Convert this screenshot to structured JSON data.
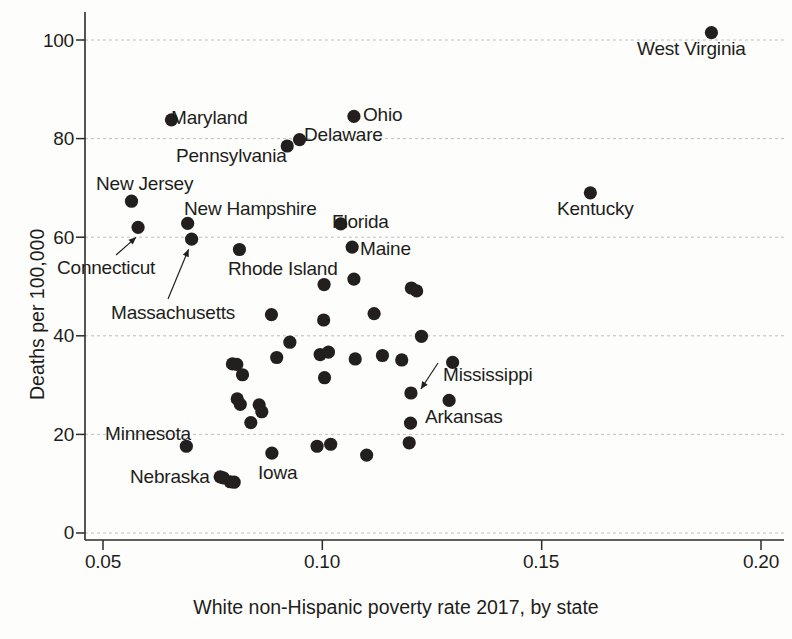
{
  "chart_data": {
    "type": "scatter",
    "title": "",
    "xlabel": "White non-Hispanic poverty rate 2017, by state",
    "ylabel": "Deaths per 100,000",
    "xlim": [
      0.0445,
      0.2025
    ],
    "ylim": [
      -6,
      108
    ],
    "xticks": [
      "0.05",
      "0.10",
      "0.15",
      "0.20"
    ],
    "xtick_values": [
      0.05,
      0.1,
      0.15,
      0.2
    ],
    "yticks": [
      "0",
      "20",
      "40",
      "60",
      "80",
      "100"
    ],
    "ytick_values": [
      0,
      20,
      40,
      60,
      80,
      100
    ],
    "grid": "horizontal-dashed",
    "legend": "none",
    "marker": "filled-circle",
    "marker_color": "#231f1e",
    "points": [
      {
        "label": "West Virginia",
        "x": 0.1887,
        "y": 101.5,
        "label_pos": "below"
      },
      {
        "label": "Ohio",
        "x": 0.1072,
        "y": 84.5,
        "label_pos": "right"
      },
      {
        "label": "Maryland",
        "x": 0.0656,
        "y": 83.8,
        "label_pos": "right"
      },
      {
        "label": "Delaware",
        "x": 0.0948,
        "y": 79.8,
        "label_pos": "right"
      },
      {
        "label": "Pennsylvania",
        "x": 0.092,
        "y": 78.5,
        "label_pos": "below"
      },
      {
        "label": "Kentucky",
        "x": 0.1611,
        "y": 69.0,
        "label_pos": "below"
      },
      {
        "label": "New Jersey",
        "x": 0.0565,
        "y": 67.3,
        "label_pos": "above"
      },
      {
        "label": "New Hampshire",
        "x": 0.0693,
        "y": 62.8,
        "label_pos": "above"
      },
      {
        "label": "Florida",
        "x": 0.1042,
        "y": 62.7,
        "label_pos": "right"
      },
      {
        "label": "Connecticut",
        "x": 0.058,
        "y": 62.0,
        "label_pos": "arrow-lower-left"
      },
      {
        "label": "Massachusetts",
        "x": 0.0702,
        "y": 59.6,
        "label_pos": "arrow-lower-left"
      },
      {
        "label": "Maine",
        "x": 0.1068,
        "y": 58.0,
        "label_pos": "right"
      },
      {
        "label": "Rhode Island",
        "x": 0.0811,
        "y": 57.5,
        "label_pos": "below"
      },
      {
        "label": "",
        "x": 0.1004,
        "y": 50.4,
        "label_pos": "none"
      },
      {
        "label": "",
        "x": 0.1072,
        "y": 51.5,
        "label_pos": "none"
      },
      {
        "label": "",
        "x": 0.1203,
        "y": 49.7,
        "label_pos": "none"
      },
      {
        "label": "",
        "x": 0.1215,
        "y": 49.1,
        "label_pos": "none"
      },
      {
        "label": "",
        "x": 0.0884,
        "y": 44.3,
        "label_pos": "none"
      },
      {
        "label": "",
        "x": 0.1003,
        "y": 43.2,
        "label_pos": "none"
      },
      {
        "label": "",
        "x": 0.1118,
        "y": 44.5,
        "label_pos": "none"
      },
      {
        "label": "",
        "x": 0.1226,
        "y": 39.9,
        "label_pos": "none"
      },
      {
        "label": "",
        "x": 0.0926,
        "y": 38.7,
        "label_pos": "none"
      },
      {
        "label": "",
        "x": 0.0795,
        "y": 34.3,
        "label_pos": "none"
      },
      {
        "label": "",
        "x": 0.0805,
        "y": 34.2,
        "label_pos": "none"
      },
      {
        "label": "",
        "x": 0.0896,
        "y": 35.6,
        "label_pos": "none"
      },
      {
        "label": "",
        "x": 0.0995,
        "y": 36.2,
        "label_pos": "none"
      },
      {
        "label": "",
        "x": 0.1014,
        "y": 36.7,
        "label_pos": "none"
      },
      {
        "label": "",
        "x": 0.1075,
        "y": 35.3,
        "label_pos": "none"
      },
      {
        "label": "",
        "x": 0.1137,
        "y": 36.0,
        "label_pos": "none"
      },
      {
        "label": "",
        "x": 0.1181,
        "y": 35.1,
        "label_pos": "none"
      },
      {
        "label": "",
        "x": 0.1297,
        "y": 34.6,
        "label_pos": "none"
      },
      {
        "label": "",
        "x": 0.0818,
        "y": 32.1,
        "label_pos": "none"
      },
      {
        "label": "",
        "x": 0.1005,
        "y": 31.5,
        "label_pos": "none"
      },
      {
        "label": "Mississippi",
        "x": 0.1202,
        "y": 28.4,
        "label_pos": "arrow-right"
      },
      {
        "label": "",
        "x": 0.0806,
        "y": 27.2,
        "label_pos": "none"
      },
      {
        "label": "",
        "x": 0.0813,
        "y": 26.1,
        "label_pos": "none"
      },
      {
        "label": "",
        "x": 0.0856,
        "y": 26.0,
        "label_pos": "none"
      },
      {
        "label": "Arkansas",
        "x": 0.1289,
        "y": 26.9,
        "label_pos": "below"
      },
      {
        "label": "",
        "x": 0.0862,
        "y": 24.6,
        "label_pos": "none"
      },
      {
        "label": "",
        "x": 0.0837,
        "y": 22.4,
        "label_pos": "none"
      },
      {
        "label": "",
        "x": 0.1201,
        "y": 22.3,
        "label_pos": "none"
      },
      {
        "label": "Minnesota",
        "x": 0.069,
        "y": 17.6,
        "label_pos": "left"
      },
      {
        "label": "",
        "x": 0.0988,
        "y": 17.6,
        "label_pos": "none"
      },
      {
        "label": "",
        "x": 0.1019,
        "y": 18.0,
        "label_pos": "none"
      },
      {
        "label": "",
        "x": 0.1198,
        "y": 18.3,
        "label_pos": "none"
      },
      {
        "label": "Iowa",
        "x": 0.0885,
        "y": 16.2,
        "label_pos": "below"
      },
      {
        "label": "",
        "x": 0.1101,
        "y": 15.8,
        "label_pos": "none"
      },
      {
        "label": "Nebraska",
        "x": 0.0767,
        "y": 11.4,
        "label_pos": "left"
      },
      {
        "label": "",
        "x": 0.0774,
        "y": 11.2,
        "label_pos": "none"
      },
      {
        "label": "",
        "x": 0.079,
        "y": 10.4,
        "label_pos": "none"
      },
      {
        "label": "",
        "x": 0.0799,
        "y": 10.3,
        "label_pos": "none"
      }
    ],
    "annotations": [
      {
        "text": "Connecticut",
        "type": "leader-arrow",
        "target_point": "Connecticut"
      },
      {
        "text": "Massachusetts",
        "type": "leader-arrow",
        "target_point": "Massachusetts"
      },
      {
        "text": "Mississippi",
        "type": "leader-arrow",
        "target_point": "Mississippi"
      }
    ]
  },
  "labels": {
    "west_virginia": "West Virginia",
    "ohio": "Ohio",
    "maryland": "Maryland",
    "delaware": "Delaware",
    "pennsylvania": "Pennsylvania",
    "kentucky": "Kentucky",
    "new_jersey": "New Jersey",
    "new_hampshire": "New Hampshire",
    "florida": "Florida",
    "connecticut": "Connecticut",
    "massachusetts": "Massachusetts",
    "maine": "Maine",
    "rhode_island": "Rhode Island",
    "mississippi": "Mississippi",
    "arkansas": "Arkansas",
    "minnesota": "Minnesota",
    "iowa": "Iowa",
    "nebraska": "Nebraska"
  },
  "axes": {
    "x_title": "White non-Hispanic poverty rate 2017, by state",
    "y_title": "Deaths per 100,000",
    "x_ticks": [
      "0.05",
      "0.10",
      "0.15",
      "0.20"
    ],
    "y_ticks": [
      "100",
      "80",
      "60",
      "40",
      "20",
      "0"
    ]
  }
}
